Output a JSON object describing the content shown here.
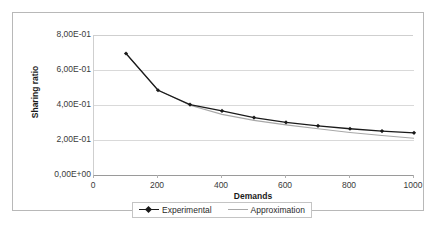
{
  "chart_data": {
    "type": "line",
    "title": "",
    "xlabel": "Demands",
    "ylabel": "Sharing ratio",
    "x": [
      100,
      200,
      300,
      400,
      500,
      600,
      700,
      800,
      900,
      1000
    ],
    "xlim": [
      0,
      1000
    ],
    "ylim": [
      0.0,
      0.8
    ],
    "grid": true,
    "legend_position": "bottom",
    "xtick_labels": [
      "0",
      "200",
      "400",
      "600",
      "800",
      "1000"
    ],
    "xtick_values": [
      0,
      200,
      400,
      600,
      800,
      1000
    ],
    "ytick_labels": [
      "0,00E+00",
      "2,00E-01",
      "4,00E-01",
      "6,00E-01",
      "8,00E-01"
    ],
    "ytick_values": [
      0.0,
      0.2,
      0.4,
      0.6,
      0.8
    ],
    "series": [
      {
        "name": "Experimental",
        "color": "#1a1a1a",
        "marker": "diamond",
        "values": [
          0.7,
          0.49,
          0.408,
          0.372,
          0.334,
          0.306,
          0.287,
          0.27,
          0.257,
          0.247
        ]
      },
      {
        "name": "Approximation",
        "color": "#a8a8a8",
        "marker": "none",
        "values": [
          0.7,
          0.492,
          0.404,
          0.352,
          0.318,
          0.292,
          0.27,
          0.249,
          0.231,
          0.216
        ]
      }
    ]
  },
  "axes": {
    "y_title": "Sharing ratio",
    "x_title": "Demands"
  },
  "legend": {
    "entries": [
      {
        "label": "Experimental"
      },
      {
        "label": "Approximation"
      }
    ]
  },
  "colors": {
    "experimental": "#1a1a1a",
    "approximation": "#a8a8a8",
    "grid": "#d9d9d9",
    "frame": "#b8b8b8",
    "axis": "#9a9a9a",
    "text": "#3a3a3a"
  }
}
